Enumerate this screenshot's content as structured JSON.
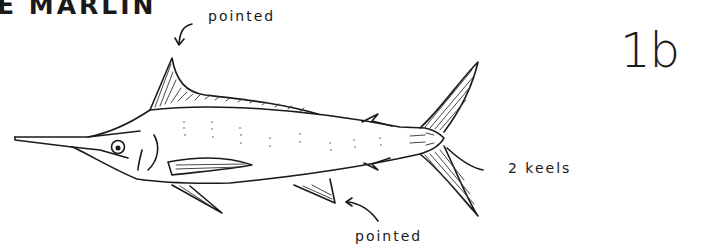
{
  "title": "E MARLIN",
  "figure_number": "1b",
  "annotations": {
    "dorsal_fin": "pointed",
    "anal_fin": "pointed",
    "tail": "2 keels"
  },
  "colors": {
    "ink": "#1a1a1a",
    "background": "#ffffff"
  }
}
